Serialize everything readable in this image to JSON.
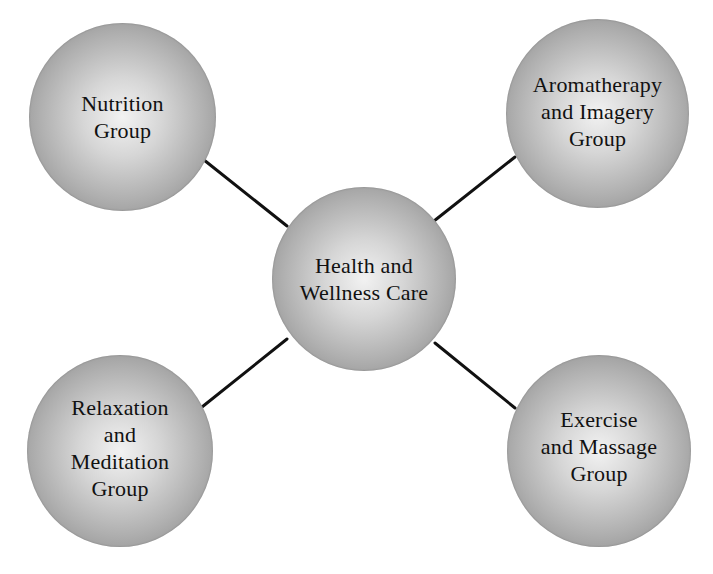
{
  "diagram": {
    "type": "hub-and-spoke",
    "center": {
      "id": "health-wellness",
      "label": "Health and\nWellness Care"
    },
    "nodes": [
      {
        "id": "nutrition",
        "label": "Nutrition\nGroup",
        "position": "top-left"
      },
      {
        "id": "aromatherapy",
        "label": "Aromatherapy\nand Imagery\nGroup",
        "position": "top-right"
      },
      {
        "id": "relaxation",
        "label": "Relaxation\nand\nMeditation\nGroup",
        "position": "bottom-left"
      },
      {
        "id": "exercise",
        "label": "Exercise\nand Massage\nGroup",
        "position": "bottom-right"
      }
    ],
    "edges": [
      {
        "from": "health-wellness",
        "to": "nutrition"
      },
      {
        "from": "health-wellness",
        "to": "aromatherapy"
      },
      {
        "from": "health-wellness",
        "to": "relaxation"
      },
      {
        "from": "health-wellness",
        "to": "exercise"
      }
    ],
    "colors": {
      "node_center": "#f2f2f2",
      "node_edge": "#858585",
      "line": "#111111",
      "text": "#111111",
      "background": "#ffffff"
    }
  }
}
